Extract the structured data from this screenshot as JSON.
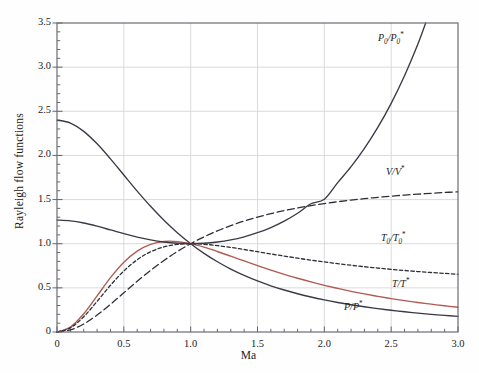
{
  "chart_data": {
    "type": "line",
    "title": "",
    "xlabel": "Ma",
    "ylabel": "Rayleigh flow functions",
    "xlim": [
      0,
      3.0
    ],
    "ylim": [
      0,
      3.5
    ],
    "grid": true,
    "legend_position": "inline-annotations",
    "xticks": [
      "0",
      "0.5",
      "1.0",
      "1.5",
      "2.0",
      "2.5",
      "3.0"
    ],
    "xtick_values": [
      0,
      0.5,
      1.0,
      1.5,
      2.0,
      2.5,
      3.0
    ],
    "xminor_step": 0.1,
    "yticks": [
      "0",
      "0.5",
      "1.0",
      "1.5",
      "2.0",
      "2.5",
      "3.0",
      "3.5"
    ],
    "ytick_values": [
      0,
      0.5,
      1.0,
      1.5,
      2.0,
      2.5,
      3.0,
      3.5
    ],
    "yminor_step": 0.1,
    "x": [
      0,
      0.1,
      0.2,
      0.3,
      0.4,
      0.5,
      0.6,
      0.7,
      0.8,
      0.9,
      1.0,
      1.1,
      1.2,
      1.3,
      1.4,
      1.5,
      1.6,
      1.7,
      1.8,
      1.9,
      2.0,
      2.1,
      2.2,
      2.3,
      2.4,
      2.5,
      2.6,
      2.7,
      2.8,
      2.9,
      3.0
    ],
    "series": [
      {
        "name": "P/P*",
        "label": "P/P*",
        "color": "#3a3a46",
        "style": "solid",
        "values": [
          2.4,
          2.3669,
          2.2727,
          2.1314,
          1.9608,
          1.7778,
          1.5957,
          1.4235,
          1.2658,
          1.1246,
          1.0,
          0.8909,
          0.7958,
          0.713,
          0.641,
          0.5783,
          0.5236,
          0.4756,
          0.4335,
          0.3964,
          0.3636,
          0.3345,
          0.3086,
          0.2855,
          0.2648,
          0.2462,
          0.2294,
          0.2142,
          0.2004,
          0.1879,
          0.1765
        ]
      },
      {
        "name": "T/T*",
        "label": "T/T*",
        "color": "#b05a50",
        "style": "solid",
        "values": [
          0.0,
          0.056,
          0.2066,
          0.4089,
          0.6152,
          0.7901,
          0.9167,
          0.9929,
          1.0255,
          1.0245,
          1.0,
          0.9603,
          0.9118,
          0.8592,
          0.8054,
          0.7525,
          0.7017,
          0.6538,
          0.6089,
          0.5673,
          0.5289,
          0.4936,
          0.4611,
          0.4312,
          0.4038,
          0.3787,
          0.3556,
          0.3344,
          0.3149,
          0.2969,
          0.2803
        ]
      },
      {
        "name": "T0/T0*",
        "label": "T₀/T₀*",
        "color": "#2e2e38",
        "style": "dashed-short",
        "values": [
          0.0,
          0.0468,
          0.1736,
          0.3469,
          0.529,
          0.6914,
          0.8189,
          0.9085,
          0.9639,
          0.9921,
          1.0,
          0.9939,
          0.9787,
          0.958,
          0.9343,
          0.9093,
          0.8842,
          0.8597,
          0.8363,
          0.8141,
          0.7934,
          0.7741,
          0.7561,
          0.7395,
          0.7241,
          0.71,
          0.6969,
          0.6848,
          0.6738,
          0.6636,
          0.654
        ]
      },
      {
        "name": "V/V*",
        "label": "V/V*",
        "color": "#2e2e38",
        "style": "dashed-long",
        "values": [
          0.0,
          0.0237,
          0.0909,
          0.1918,
          0.3137,
          0.4444,
          0.5745,
          0.6975,
          0.8101,
          0.911,
          1.0,
          1.078,
          1.1459,
          1.205,
          1.2564,
          1.3012,
          1.3403,
          1.3746,
          1.4046,
          1.4311,
          1.4545,
          1.4753,
          1.4938,
          1.5103,
          1.5252,
          1.5385,
          1.5505,
          1.5613,
          1.5711,
          1.5801,
          1.5882
        ]
      },
      {
        "name": "P0/P0*",
        "label": "P₀/P₀*",
        "color": "#3a3a46",
        "style": "solid",
        "values": [
          1.2679,
          1.2591,
          1.2346,
          1.1985,
          1.1566,
          1.1141,
          1.0753,
          1.0431,
          1.0193,
          1.0049,
          1.0,
          1.0049,
          1.0194,
          1.0437,
          1.0785,
          1.1246,
          1.1833,
          1.256,
          1.3449,
          1.4524,
          1.5031,
          1.692,
          1.8731,
          2.0804,
          2.3179,
          2.5902,
          2.9026,
          3.2612,
          3.6728,
          4.1455,
          4.6875
        ]
      }
    ],
    "annotations": [
      {
        "text": "P0/P0*",
        "x": 2.52,
        "y": 3.22
      },
      {
        "text": "V/V*",
        "x": 2.58,
        "y": 1.78
      },
      {
        "text": "T0/T0*",
        "x": 2.55,
        "y": 0.95
      },
      {
        "text": "T/T*",
        "x": 2.62,
        "y": 0.52
      },
      {
        "text": "P/P*",
        "x": 2.2,
        "y": 0.3
      }
    ]
  },
  "axis": {
    "ylabel": "Rayleigh flow functions",
    "xlabel": "Ma"
  },
  "colors": {
    "frame": "#6b6b73",
    "grid": "#d6d6da",
    "curve_dark": "#3a3a46",
    "curve_red": "#b05a50",
    "background": "#fefefe"
  }
}
